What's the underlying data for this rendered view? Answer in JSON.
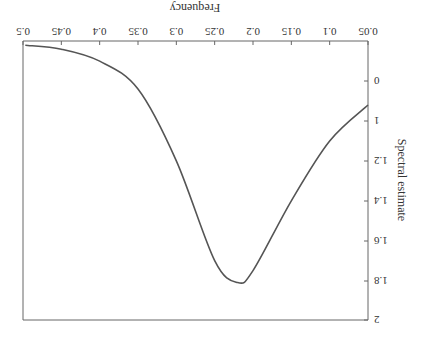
{
  "chart_data": {
    "type": "line",
    "orientation_note": "image rendered rotated 180 degrees",
    "title": "",
    "xlabel": "Frequency",
    "ylabel": "Spectral estimate",
    "x_ticks": [
      "0.05",
      "0.1",
      "0.15",
      "0.2",
      "0.25",
      "0.3",
      "0.35",
      "0.4",
      "0.45",
      "0.5"
    ],
    "y_ticks": [
      "0",
      "1",
      "1.2",
      "1.4",
      "1.6",
      "1.8",
      "2"
    ],
    "xlim": [
      0.05,
      0.5
    ],
    "ylim": [
      0.8,
      2
    ],
    "grid": false,
    "series": [
      {
        "name": "Spectral estimate",
        "color": "#555555",
        "x": [
          0.05,
          0.1,
          0.15,
          0.2,
          0.22,
          0.25,
          0.3,
          0.35,
          0.4,
          0.45,
          0.497
        ],
        "values": [
          0.92,
          1.1,
          1.4,
          1.75,
          1.81,
          1.7,
          1.2,
          0.84,
          0.7,
          0.64,
          0.62
        ]
      }
    ]
  }
}
